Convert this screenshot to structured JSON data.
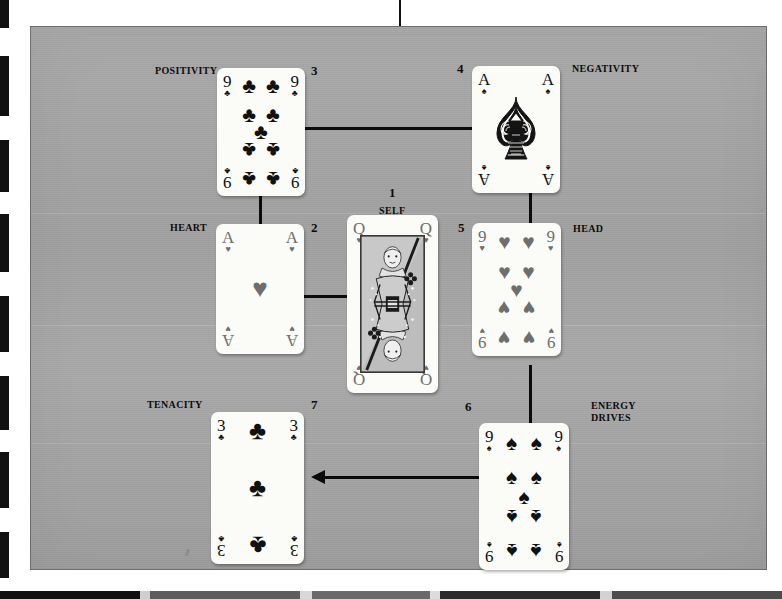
{
  "spread": {
    "title": "Seven-card cross spread",
    "background_color": "#a4a4a4",
    "card_color": "#fbfbf8",
    "ink_color": "#0b0b0b"
  },
  "positions": [
    {
      "number": "1",
      "label": "SELF",
      "label_align": "center",
      "card": {
        "rank": "Q",
        "suit": "hearts",
        "suit_glyph": "♥",
        "type": "court",
        "color": "red",
        "name": "Queen of Hearts"
      }
    },
    {
      "number": "2",
      "label": "HEART",
      "label_align": "left",
      "card": {
        "rank": "A",
        "suit": "hearts",
        "suit_glyph": "♥",
        "type": "ace",
        "color": "red",
        "name": "Ace of Hearts"
      }
    },
    {
      "number": "3",
      "label": "POSITIVITY",
      "label_align": "left",
      "card": {
        "rank": "9",
        "suit": "clubs",
        "suit_glyph": "♣",
        "type": "pip",
        "color": "black",
        "name": "Nine of Clubs"
      }
    },
    {
      "number": "4",
      "label": "NEGATIVITY",
      "label_align": "right",
      "card": {
        "rank": "A",
        "suit": "spades",
        "suit_glyph": "♠",
        "type": "ace-ornate",
        "color": "black",
        "name": "Ace of Spades",
        "center_text": ""
      }
    },
    {
      "number": "5",
      "label": "HEAD",
      "label_align": "right",
      "card": {
        "rank": "9",
        "suit": "hearts",
        "suit_glyph": "♥",
        "type": "pip",
        "color": "red",
        "name": "Nine of Hearts"
      }
    },
    {
      "number": "6",
      "label": "ENERGY\nDRIVES",
      "label_align": "right",
      "card": {
        "rank": "9",
        "suit": "spades",
        "suit_glyph": "♠",
        "type": "pip",
        "color": "black",
        "name": "Nine of Spades"
      }
    },
    {
      "number": "7",
      "label": "TENACITY",
      "label_align": "left",
      "card": {
        "rank": "3",
        "suit": "clubs",
        "suit_glyph": "♣",
        "type": "pip",
        "color": "black",
        "name": "Three of Clubs"
      }
    }
  ],
  "connectors": [
    {
      "from": "3",
      "to": "4",
      "style": "line",
      "orientation": "horizontal"
    },
    {
      "from": "3",
      "to": "2",
      "style": "line",
      "orientation": "vertical"
    },
    {
      "from": "4",
      "to": "5",
      "style": "line",
      "orientation": "vertical"
    },
    {
      "from": "2",
      "to": "1",
      "style": "line",
      "orientation": "horizontal"
    },
    {
      "from": "5",
      "to": "6",
      "style": "line",
      "orientation": "vertical"
    },
    {
      "from": "6",
      "to": "7",
      "style": "arrow",
      "orientation": "horizontal",
      "direction": "left"
    }
  ]
}
